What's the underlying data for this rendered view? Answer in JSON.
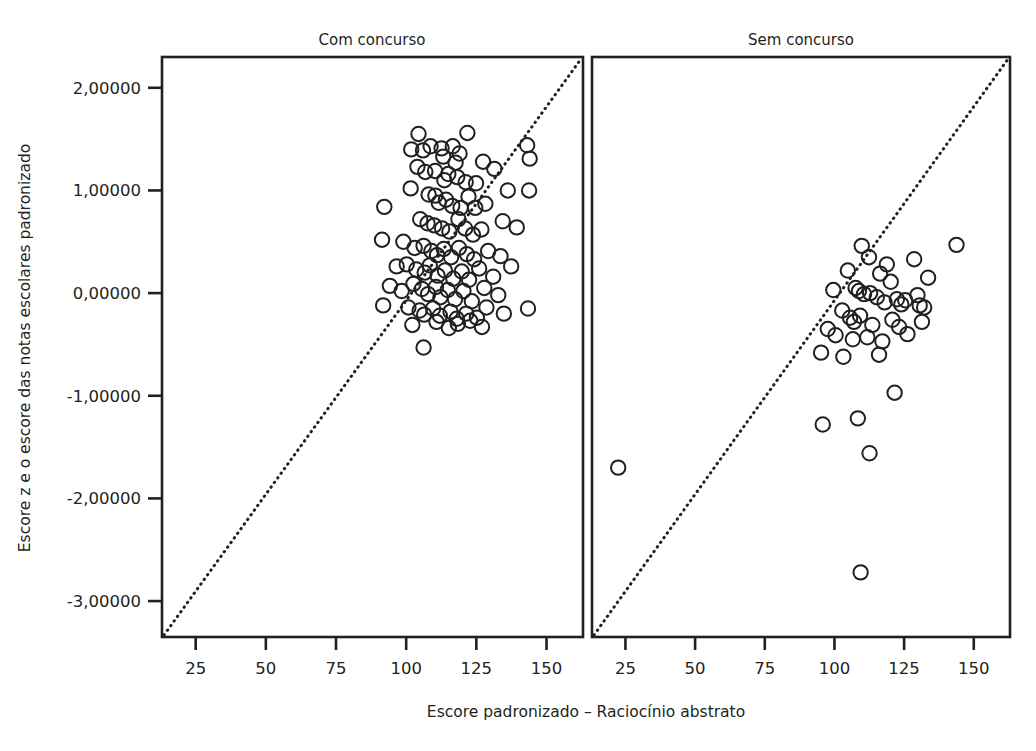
{
  "chart_data": {
    "type": "scatter",
    "title": "",
    "xlabel": "Escore padronizado – Raciocínio abstrato",
    "ylabel": "Escore z e o escore das notas escolares padronizado",
    "xlim": [
      13,
      163
    ],
    "ylim": [
      -3.35,
      2.3
    ],
    "xticks": [
      25,
      50,
      75,
      100,
      125,
      150
    ],
    "xticklabels": [
      "25",
      "50",
      "75",
      "100",
      "125",
      "150"
    ],
    "yticks": [
      2,
      1,
      0,
      -1,
      -2,
      -3
    ],
    "yticklabels": [
      "2,00000",
      "1,00000",
      "0,00000",
      "-1,00000",
      "-2,00000",
      "-3,00000"
    ],
    "grid": false,
    "legend": null,
    "marker": "open-circle",
    "marker_color": "#231f20",
    "reference_line": {
      "style": "dotted",
      "color": "#231f20",
      "description": "identity/diagonal reference line from lower-left corner to upper-right corner of each panel"
    },
    "panels": [
      {
        "label": "Com concurso",
        "points": [
          [
            104.4,
            1.55
          ],
          [
            101.8,
            1.4
          ],
          [
            106.0,
            1.39
          ],
          [
            108.7,
            1.43
          ],
          [
            112.6,
            1.41
          ],
          [
            113.2,
            1.33
          ],
          [
            116.6,
            1.43
          ],
          [
            119.0,
            1.36
          ],
          [
            117.6,
            1.27
          ],
          [
            121.8,
            1.56
          ],
          [
            104.0,
            1.23
          ],
          [
            106.8,
            1.18
          ],
          [
            110.3,
            1.19
          ],
          [
            113.6,
            1.1
          ],
          [
            115.0,
            1.16
          ],
          [
            118.2,
            1.13
          ],
          [
            121.2,
            1.08
          ],
          [
            124.9,
            1.07
          ],
          [
            127.4,
            1.28
          ],
          [
            131.4,
            1.21
          ],
          [
            143.1,
            1.44
          ],
          [
            144.0,
            1.31
          ],
          [
            101.6,
            1.02
          ],
          [
            108.0,
            0.96
          ],
          [
            110.4,
            0.95
          ],
          [
            111.6,
            0.88
          ],
          [
            114.2,
            0.91
          ],
          [
            116.4,
            0.85
          ],
          [
            119.4,
            0.83
          ],
          [
            122.2,
            0.94
          ],
          [
            124.6,
            0.83
          ],
          [
            128.2,
            0.87
          ],
          [
            136.2,
            1.0
          ],
          [
            143.8,
            1.0
          ],
          [
            92.2,
            0.84
          ],
          [
            105.0,
            0.72
          ],
          [
            107.6,
            0.68
          ],
          [
            110.0,
            0.66
          ],
          [
            112.8,
            0.63
          ],
          [
            115.4,
            0.6
          ],
          [
            118.6,
            0.72
          ],
          [
            121.0,
            0.63
          ],
          [
            123.8,
            0.57
          ],
          [
            126.8,
            0.62
          ],
          [
            134.4,
            0.7
          ],
          [
            139.4,
            0.64
          ],
          [
            91.4,
            0.52
          ],
          [
            99.0,
            0.5
          ],
          [
            103.0,
            0.44
          ],
          [
            106.2,
            0.46
          ],
          [
            109.0,
            0.41
          ],
          [
            111.0,
            0.37
          ],
          [
            113.4,
            0.43
          ],
          [
            116.0,
            0.35
          ],
          [
            118.8,
            0.44
          ],
          [
            121.6,
            0.38
          ],
          [
            124.2,
            0.33
          ],
          [
            129.2,
            0.41
          ],
          [
            133.6,
            0.36
          ],
          [
            96.6,
            0.26
          ],
          [
            100.2,
            0.28
          ],
          [
            103.6,
            0.23
          ],
          [
            106.6,
            0.2
          ],
          [
            108.4,
            0.27
          ],
          [
            111.2,
            0.17
          ],
          [
            113.8,
            0.22
          ],
          [
            116.8,
            0.14
          ],
          [
            119.8,
            0.21
          ],
          [
            122.4,
            0.13
          ],
          [
            126.0,
            0.24
          ],
          [
            131.0,
            0.16
          ],
          [
            137.4,
            0.26
          ],
          [
            94.2,
            0.07
          ],
          [
            98.4,
            0.02
          ],
          [
            102.6,
            0.09
          ],
          [
            105.6,
            0.04
          ],
          [
            107.8,
            -0.01
          ],
          [
            110.6,
            0.06
          ],
          [
            112.2,
            -0.04
          ],
          [
            114.8,
            0.03
          ],
          [
            117.4,
            -0.06
          ],
          [
            120.4,
            0.02
          ],
          [
            123.4,
            -0.08
          ],
          [
            127.8,
            0.05
          ],
          [
            132.8,
            -0.02
          ],
          [
            91.8,
            -0.12
          ],
          [
            100.8,
            -0.14
          ],
          [
            104.8,
            -0.17
          ],
          [
            106.4,
            -0.21
          ],
          [
            109.6,
            -0.15
          ],
          [
            112.0,
            -0.22
          ],
          [
            115.8,
            -0.18
          ],
          [
            118.0,
            -0.25
          ],
          [
            121.4,
            -0.2
          ],
          [
            125.2,
            -0.24
          ],
          [
            128.6,
            -0.14
          ],
          [
            134.8,
            -0.2
          ],
          [
            143.4,
            -0.15
          ],
          [
            102.2,
            -0.31
          ],
          [
            110.8,
            -0.28
          ],
          [
            115.2,
            -0.34
          ],
          [
            118.4,
            -0.3
          ],
          [
            122.8,
            -0.27
          ],
          [
            127.0,
            -0.33
          ],
          [
            106.2,
            -0.53
          ]
        ]
      },
      {
        "label": "Sem concurso",
        "points": [
          [
            109.8,
            0.46
          ],
          [
            143.8,
            0.47
          ],
          [
            112.4,
            0.35
          ],
          [
            118.8,
            0.28
          ],
          [
            128.6,
            0.33
          ],
          [
            104.8,
            0.22
          ],
          [
            116.4,
            0.19
          ],
          [
            120.2,
            0.11
          ],
          [
            133.6,
            0.15
          ],
          [
            99.6,
            0.03
          ],
          [
            107.6,
            0.05
          ],
          [
            108.8,
            0.02
          ],
          [
            110.6,
            -0.01
          ],
          [
            112.8,
            0.0
          ],
          [
            115.2,
            -0.04
          ],
          [
            118.0,
            -0.09
          ],
          [
            122.4,
            -0.06
          ],
          [
            124.0,
            -0.11
          ],
          [
            125.4,
            -0.07
          ],
          [
            129.8,
            -0.02
          ],
          [
            130.6,
            -0.12
          ],
          [
            132.2,
            -0.14
          ],
          [
            102.8,
            -0.17
          ],
          [
            105.6,
            -0.24
          ],
          [
            107.0,
            -0.28
          ],
          [
            109.2,
            -0.22
          ],
          [
            113.6,
            -0.31
          ],
          [
            120.8,
            -0.26
          ],
          [
            123.2,
            -0.33
          ],
          [
            131.4,
            -0.28
          ],
          [
            97.6,
            -0.35
          ],
          [
            100.4,
            -0.41
          ],
          [
            106.6,
            -0.45
          ],
          [
            111.8,
            -0.43
          ],
          [
            117.2,
            -0.47
          ],
          [
            126.2,
            -0.4
          ],
          [
            95.2,
            -0.58
          ],
          [
            103.2,
            -0.62
          ],
          [
            116.0,
            -0.6
          ],
          [
            121.6,
            -0.97
          ],
          [
            108.4,
            -1.22
          ],
          [
            95.8,
            -1.28
          ],
          [
            112.6,
            -1.56
          ],
          [
            22.4,
            -1.7
          ],
          [
            109.4,
            -2.72
          ]
        ]
      }
    ]
  },
  "axes": {
    "y_title": "Escore z e o escore das notas escolares padronizado",
    "x_title": "Escore padronizado – Raciocínio abstrato",
    "y_tick_labels": [
      "2,00000",
      "1,00000",
      "0,00000",
      "-1,00000",
      "-2,00000",
      "-3,00000"
    ],
    "x_tick_labels_left": [
      "25",
      "50",
      "75",
      "100",
      "125",
      "150"
    ],
    "x_tick_labels_right": [
      "25",
      "50",
      "75",
      "100",
      "125",
      "150"
    ]
  },
  "panel_titles": {
    "left": "Com concurso",
    "right": "Sem concurso"
  },
  "colors": {
    "ink": "#231f20",
    "background": "#ffffff"
  }
}
